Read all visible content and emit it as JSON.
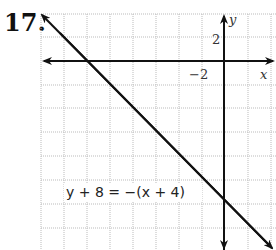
{
  "problem_number": "17.",
  "graph": {
    "x_axis_label": "x",
    "y_axis_label": "y",
    "tick_labels": {
      "x": "−2",
      "y": "2"
    },
    "grid_step": 2,
    "equation": "y + 8 = −(x + 4)"
  }
}
